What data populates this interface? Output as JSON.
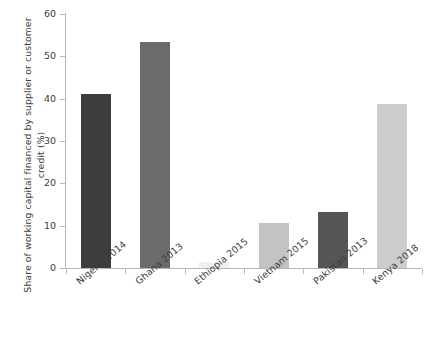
{
  "chart_data": {
    "type": "bar",
    "title": "",
    "xlabel": "",
    "ylabel": "Share of working capital financed by supplier or customer credit (%)",
    "ylim": [
      0,
      60
    ],
    "yticks": [
      0,
      10,
      20,
      30,
      40,
      50,
      60
    ],
    "grid": false,
    "legend": "none",
    "categories": [
      "Nigeria 2014",
      "Ghana 2013",
      "Ethiopia 2015",
      "Vietnam 2015",
      "Pakistan 2013",
      "Kenya 2018"
    ],
    "values": [
      41.1,
      53.4,
      1.5,
      10.6,
      13.2,
      38.7
    ],
    "bar_colors": [
      "#3d3d3d",
      "#6b6b6b",
      "#efefef",
      "#c3c3c3",
      "#555555",
      "#cdcdcd"
    ],
    "series": [
      {
        "name": "Share of working capital financed by supplier or customer credit (%)",
        "values": [
          41.1,
          53.4,
          1.5,
          10.6,
          13.2,
          38.7
        ]
      }
    ],
    "axis_color": "#b9b9b9",
    "text_color": "#3c3c3c",
    "background": "#ffffff"
  }
}
